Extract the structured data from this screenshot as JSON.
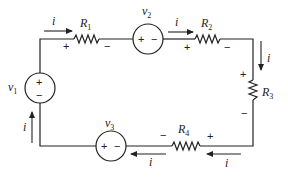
{
  "diagram": {
    "type": "series circuit",
    "current_label": "i",
    "sources": [
      {
        "id": "v1",
        "label": "v",
        "sub": "1",
        "polarity_top": "+",
        "polarity_bottom": "−"
      },
      {
        "id": "v2",
        "label": "v",
        "sub": "2",
        "polarity_left": "+",
        "polarity_right": "−"
      },
      {
        "id": "v3",
        "label": "v",
        "sub": "3",
        "polarity_left": "+",
        "polarity_right": "−"
      }
    ],
    "resistors": [
      {
        "id": "R1",
        "label": "R",
        "sub": "1",
        "plus": "+",
        "minus": "−"
      },
      {
        "id": "R2",
        "label": "R",
        "sub": "2",
        "plus": "+",
        "minus": "−"
      },
      {
        "id": "R3",
        "label": "R",
        "sub": "3",
        "plus": "+",
        "minus": "−"
      },
      {
        "id": "R4",
        "label": "R",
        "sub": "4",
        "plus": "+",
        "minus": "−"
      }
    ],
    "currents": [
      {
        "id": "i_top_left",
        "label": "i",
        "direction": "right"
      },
      {
        "id": "i_top_right",
        "label": "i",
        "direction": "right"
      },
      {
        "id": "i_right",
        "label": "i",
        "direction": "down"
      },
      {
        "id": "i_bottom_right",
        "label": "i",
        "direction": "left"
      },
      {
        "id": "i_bottom_left",
        "label": "i",
        "direction": "left"
      },
      {
        "id": "i_left",
        "label": "i",
        "direction": "up"
      }
    ],
    "colors": {
      "ink": "#222222",
      "background": "#ffffff"
    }
  }
}
